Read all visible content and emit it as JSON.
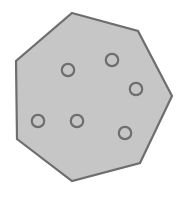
{
  "figure": {
    "canvas": {
      "width": 191,
      "height": 198,
      "background_color": "#ffffff"
    },
    "shape": {
      "name": "heptagon",
      "sides": 7,
      "fill_color": "#c6c6c6",
      "stroke_color": "#6e6e6e",
      "stroke_width": 2.2,
      "vertices": [
        {
          "x": 72,
          "y": 13
        },
        {
          "x": 138,
          "y": 31
        },
        {
          "x": 172,
          "y": 96
        },
        {
          "x": 140,
          "y": 163
        },
        {
          "x": 72,
          "y": 181
        },
        {
          "x": 17,
          "y": 139
        },
        {
          "x": 16,
          "y": 61
        }
      ]
    },
    "holes": {
      "count": 6,
      "fill_color": "#c6c6c6",
      "stroke_color": "#6e6e6e",
      "stroke_width": 2.2,
      "radius": 6.2,
      "items": [
        {
          "id": "hole-1",
          "x": 68,
          "y": 70
        },
        {
          "id": "hole-2",
          "x": 112,
          "y": 60
        },
        {
          "id": "hole-3",
          "x": 136,
          "y": 89
        },
        {
          "id": "hole-4",
          "x": 125,
          "y": 133
        },
        {
          "id": "hole-5",
          "x": 38,
          "y": 121
        },
        {
          "id": "hole-6",
          "x": 77,
          "y": 121
        }
      ]
    }
  }
}
